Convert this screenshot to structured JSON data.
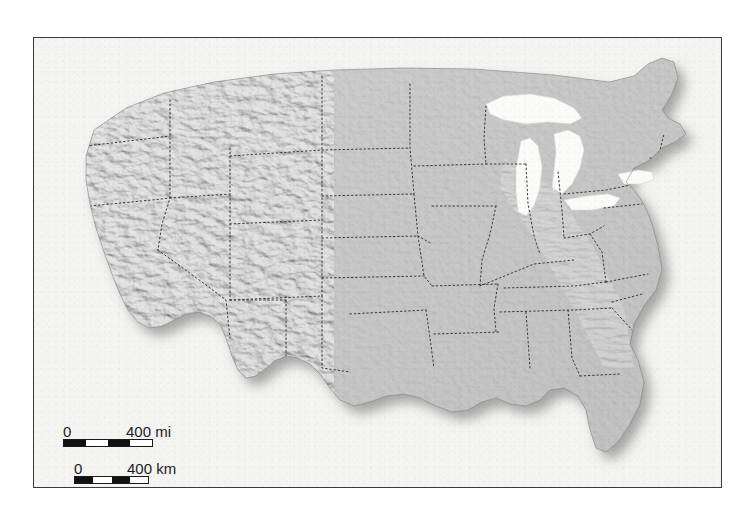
{
  "map": {
    "title": "United States shaded relief map",
    "region": "Contiguous United States",
    "style": "grayscale shaded relief",
    "frame": {
      "border_color": "#3a3a3a",
      "plate_color": "#f4f4f2"
    },
    "colors": {
      "land": "#a8a8a8",
      "land_light": "#c3c3c3",
      "land_dark": "#8d8d8d",
      "water": "#f6f6f4",
      "lake": "#fbfbfa",
      "boundary": "#3b3b3b",
      "shadow": "#3a3a3a",
      "text": "#1c1c1c"
    },
    "features": {
      "great_lakes": [
        "Lake Superior",
        "Lake Michigan",
        "Lake Huron",
        "Lake Erie",
        "Lake Ontario"
      ],
      "boundary_style": "dotted state borders",
      "relief": "hillshade, light from northwest"
    }
  },
  "scale_bars": [
    {
      "id": "miles",
      "min_label": "0",
      "max_label": "400 mi",
      "value": 400,
      "unit": "mi",
      "segments": 4,
      "bar_width_px": 90
    },
    {
      "id": "kilometers",
      "min_label": "0",
      "max_label": "400 km",
      "value": 400,
      "unit": "km",
      "segments": 4,
      "bar_width_px": 75
    }
  ]
}
